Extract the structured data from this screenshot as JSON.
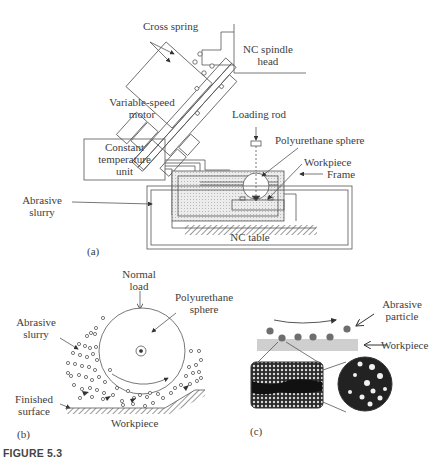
{
  "figure": {
    "caption": "FIGURE 5.3"
  },
  "panel_a": {
    "tag": "(a)",
    "labels": {
      "cross_spring": "Cross spring",
      "nc_spindle_head_line1": "NC spindle",
      "nc_spindle_head_line2": "head",
      "variable_speed_motor_line1": "Variable-speed",
      "variable_speed_motor_line2": "motor",
      "loading_rod": "Loading rod",
      "polyurethane_sphere": "Polyurethane sphere",
      "workpiece": "Workpiece",
      "frame": "Frame",
      "constant_temp_line1": "Constant",
      "constant_temp_line2": "temperature",
      "constant_temp_line3": "unit",
      "abrasive_slurry_line1": "Abrasive",
      "abrasive_slurry_line2": "slurry",
      "nc_table": "NC table"
    }
  },
  "panel_b": {
    "tag": "(b)",
    "labels": {
      "normal_load_line1": "Normal",
      "normal_load_line2": "load",
      "polyurethane_line1": "Polyurethane",
      "polyurethane_line2": "sphere",
      "abrasive_slurry_line1": "Abrasive",
      "abrasive_slurry_line2": "slurry",
      "finished_surface_line1": "Finished",
      "finished_surface_line2": "surface",
      "workpiece": "Workpiece"
    }
  },
  "panel_c": {
    "tag": "(c)",
    "labels": {
      "abrasive_particle_line1": "Abrasive",
      "abrasive_particle_line2": "particle",
      "workpiece": "Workpiece"
    },
    "colors": {
      "particle": "#6e6e6e",
      "workpiece_band": "#cfcfcf",
      "lattice_dark": "#1a1a1a"
    }
  }
}
